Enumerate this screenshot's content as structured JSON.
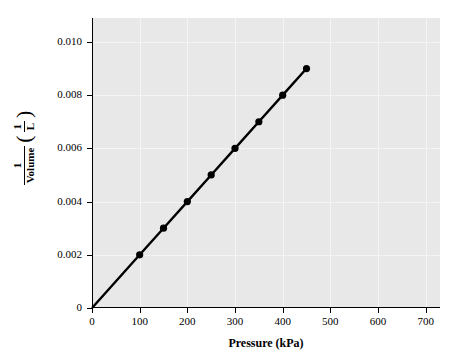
{
  "chart_data": {
    "type": "line",
    "title": "",
    "xlabel": "Pressure (kPa)",
    "ylabel_numerator": "1",
    "ylabel_denominator": "Volume",
    "ylabel_unit_numerator": "1",
    "ylabel_unit_denominator": "L",
    "x": [
      0,
      100,
      150,
      200,
      250,
      300,
      350,
      400,
      450
    ],
    "y": [
      0,
      0.002,
      0.003,
      0.004,
      0.005,
      0.006,
      0.007,
      0.008,
      0.009
    ],
    "series": [
      {
        "name": "1/Volume vs Pressure",
        "x": [
          0,
          100,
          150,
          200,
          250,
          300,
          350,
          400,
          450
        ],
        "values": [
          0,
          0.002,
          0.003,
          0.004,
          0.005,
          0.006,
          0.007,
          0.008,
          0.009
        ]
      }
    ],
    "markers_shown_at_x": [
      100,
      150,
      200,
      250,
      300,
      350,
      400,
      450
    ],
    "xlim": [
      0,
      730
    ],
    "ylim": [
      0,
      0.0109
    ],
    "xticks": [
      0,
      100,
      200,
      300,
      400,
      500,
      600,
      700
    ],
    "yticks": [
      0,
      0.002,
      0.004,
      0.006,
      0.008,
      0.01
    ],
    "xtick_labels": [
      "0",
      "100",
      "200",
      "300",
      "400",
      "500",
      "600",
      "700"
    ],
    "ytick_labels": [
      "0",
      "0.002",
      "0.004",
      "0.006",
      "0.008",
      "0.010"
    ],
    "grid": true,
    "legend": "none",
    "line_color": "#000000",
    "marker_color": "#000000",
    "plot_background": "#e8e8e8",
    "grid_color": "#f4f4f4",
    "figure_background": "#ffffff"
  }
}
